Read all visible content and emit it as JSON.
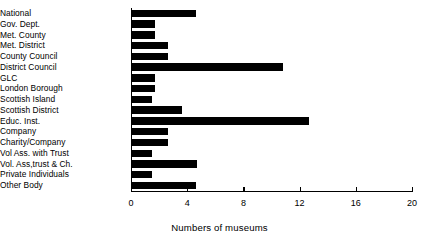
{
  "chart_data": {
    "type": "bar",
    "orientation": "horizontal",
    "title": "",
    "xlabel": "Numbers of museums",
    "ylabel": "",
    "xlim": [
      0,
      20
    ],
    "xticks": [
      0,
      4,
      8,
      12,
      16,
      20
    ],
    "xtick_labels": [
      "0",
      "4",
      "8",
      "12",
      "16",
      "20"
    ],
    "grid": false,
    "legend": null,
    "categories": [
      "National",
      "Gov. Dept.",
      "Met. County",
      "Met. District",
      "County Council",
      "District Council",
      "GLC",
      "London Borough",
      "Scottish Island",
      "Scottish District",
      "Educ. Inst.",
      "Company",
      "Charity/Company",
      "Vol Ass. with Trust",
      "Vol. Ass,trust & Ch.",
      "Private Individuals",
      "Other Body"
    ],
    "values": [
      4.6,
      1.7,
      1.7,
      2.6,
      2.6,
      10.8,
      1.7,
      1.7,
      1.5,
      3.6,
      12.7,
      2.6,
      2.6,
      1.5,
      4.7,
      1.5,
      4.6
    ],
    "bar_color": "#000000",
    "axis_color": "#000000",
    "background": "#ffffff"
  }
}
